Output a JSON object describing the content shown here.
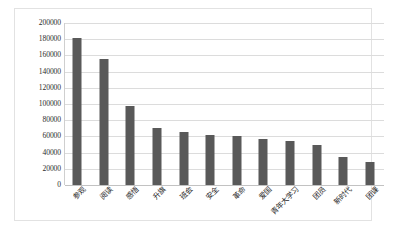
{
  "chart_data": {
    "type": "bar",
    "title": "",
    "subtitle": "",
    "xlabel": "",
    "ylabel": "",
    "ylim": [
      0,
      200000
    ],
    "ytick_step": 20000,
    "grid": true,
    "legend": false,
    "bar_color": "#595959",
    "gridline_color": "#dcdcdc",
    "plot_background": "#ffffff",
    "categories": [
      "参观",
      "阅读",
      "感悟",
      "升旗",
      "班会",
      "安全",
      "革命",
      "爱国",
      "青年大学习",
      "团员",
      "新时代",
      "团课"
    ],
    "values": [
      181000,
      155000,
      97000,
      70000,
      65000,
      62000,
      60000,
      57000,
      54000,
      50000,
      35000,
      28000
    ],
    "yticks": [
      "200000",
      "180000",
      "160000",
      "140000",
      "120000",
      "100000",
      "80000",
      "60000",
      "40000",
      "20000",
      "0"
    ]
  },
  "caption": {
    "text": ""
  }
}
